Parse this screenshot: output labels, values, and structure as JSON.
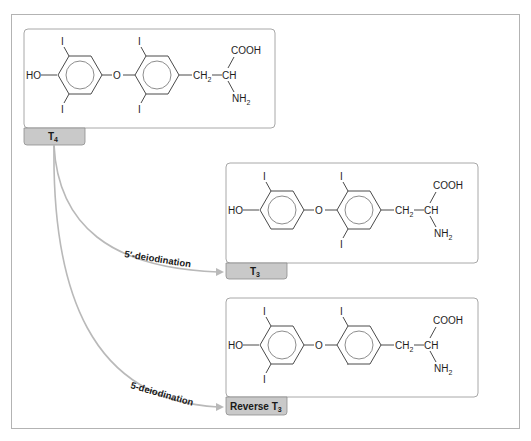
{
  "diagram": {
    "type": "reaction-pathway",
    "frame_color": "#b3b3b3",
    "tab_color": "#c9c9c9",
    "arrow_color": "#b9b9b9",
    "molecules": [
      {
        "id": "t4",
        "label_main": "T",
        "label_sub": "4",
        "atoms": {
          "ho": "HO",
          "o": "O",
          "iodine": "I",
          "ch2_main": "CH",
          "ch2_sub": "2",
          "ch": "CH",
          "cooh": "COOH",
          "nh2_main": "NH",
          "nh2_sub": "2"
        },
        "iodines": 4
      },
      {
        "id": "t3",
        "label_main": "T",
        "label_sub": "3",
        "atoms": {
          "ho": "HO",
          "o": "O",
          "iodine": "I",
          "ch2_main": "CH",
          "ch2_sub": "2",
          "ch": "CH",
          "cooh": "COOH",
          "nh2_main": "NH",
          "nh2_sub": "2"
        },
        "iodines": 3
      },
      {
        "id": "reverse-t3",
        "label_main": "Reverse T",
        "label_sub": "3",
        "atoms": {
          "ho": "HO",
          "o": "O",
          "iodine": "I",
          "ch2_main": "CH",
          "ch2_sub": "2",
          "ch": "CH",
          "cooh": "COOH",
          "nh2_main": "NH",
          "nh2_sub": "2"
        },
        "iodines": 3
      }
    ],
    "arrows": [
      {
        "from": "T4",
        "to": "T3",
        "label": "5′-deiodination"
      },
      {
        "from": "T4",
        "to": "Reverse T3",
        "label": "5-deiodination"
      }
    ]
  }
}
